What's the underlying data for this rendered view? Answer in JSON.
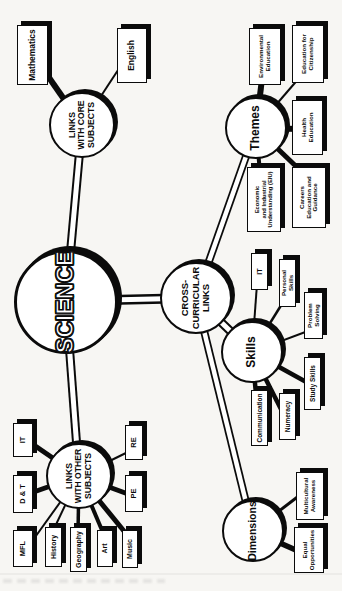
{
  "page_bg": "#f7f6f3",
  "ink": "#0b0b0b",
  "center": {
    "label": "SCIENCE"
  },
  "hubs": {
    "core": {
      "label": "LINKS\nWITH CORE\nSUBJECTS"
    },
    "other": {
      "label": "LINKS\nWITH OTHER\nSUBJECTS"
    },
    "cross": {
      "label": "CROSS-\nCURRICULAR\nLINKS"
    },
    "themes": {
      "label": "Themes"
    },
    "skills": {
      "label": "Skills"
    },
    "dimensions": {
      "label": "Dimensions"
    }
  },
  "boxes": {
    "mathematics": {
      "label": "Mathematics"
    },
    "english": {
      "label": "English"
    },
    "it_subject": {
      "label": "IT"
    },
    "dt": {
      "label": "D & T"
    },
    "mfl": {
      "label": "MFL"
    },
    "history": {
      "label": "History"
    },
    "geography": {
      "label": "Geography"
    },
    "art": {
      "label": "Art"
    },
    "music": {
      "label": "Music"
    },
    "pe": {
      "label": "PE"
    },
    "re": {
      "label": "RE"
    },
    "environmental": {
      "label": "Environmental\nEducation"
    },
    "citizenship": {
      "label": "Education for\nCitizenship"
    },
    "health": {
      "label": "Health\nEducation"
    },
    "eiu": {
      "label": "Economic\nand Industrial\nUnderstanding (EIU)"
    },
    "careers": {
      "label": "Careers\nEducation and\nGuidance"
    },
    "it_skill": {
      "label": "IT"
    },
    "personal_skills": {
      "label": "Personal Skills"
    },
    "problem_solving": {
      "label": "Problem Solving"
    },
    "study_skills": {
      "label": "Study Skills"
    },
    "numeracy": {
      "label": "Numeracy"
    },
    "communication": {
      "label": "Communication"
    },
    "multicultural": {
      "label": "Multicultural\nAwareness"
    },
    "equal_opportunities": {
      "label": "Equal\nOpportunities"
    }
  }
}
